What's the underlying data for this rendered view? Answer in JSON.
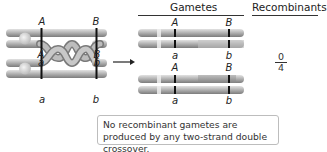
{
  "headers": {
    "gametes": "Gametes",
    "recombinants": "Recombinants"
  },
  "left_labels": {
    "top_A": "A",
    "top_B": "B",
    "mid_A": "A",
    "mid_B": "B",
    "mid_a": "a",
    "mid_b": "b",
    "bot_a": "a",
    "bot_b": "b"
  },
  "gamete_labels": {
    "g1_A": "A",
    "g1_B": "B",
    "g2_a": "a",
    "g2_b": "b",
    "g3_A": "A",
    "g3_B": "B",
    "g4_a": "a",
    "g4_b": "b"
  },
  "recombinant_fraction": {
    "numerator": "0",
    "denominator": "4"
  },
  "caption": "No recombinant gametes are produced by any two-strand double crossover.",
  "colors": {
    "chromatid_light": "#d9d9d9",
    "chromatid_mid": "#a8a8a8",
    "chromatid_dark": "#7a7a7a",
    "band": "#111111",
    "centromere": "#e6e6e6"
  }
}
